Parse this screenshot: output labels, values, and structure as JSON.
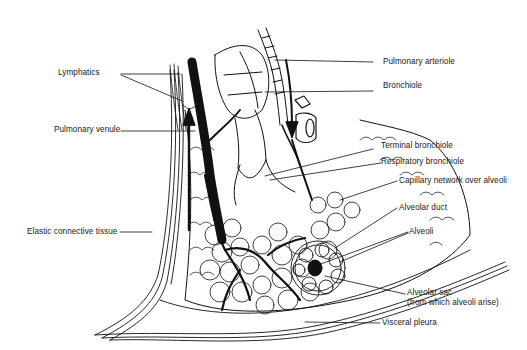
{
  "diagram": {
    "colors": {
      "ink": "#111111",
      "paper": "#ffffff",
      "label": "#1a1a1a"
    },
    "labels": {
      "lymphatics": "Lymphatics",
      "pulmonary_venule": "Pulmonary venule",
      "elastic_connective_tissue": "Elastic connective tissue",
      "pulmonary_arteriole": "Pulmonary arteriole",
      "bronchiole": "Bronchiole",
      "terminal_bronchiole": "Terminal bronchiole",
      "respiratory_bronchiole": "Respiratory bronchiole",
      "capillary_network": "Capillary network over alveoli",
      "alveolar_duct": "Alveolar duct",
      "alveoli": "Alveoli",
      "alveolar_sac_line1": "Alveolar sac",
      "alveolar_sac_line2": "(from which alveoli arise)",
      "visceral_pleura": "Visceral pleura"
    }
  }
}
